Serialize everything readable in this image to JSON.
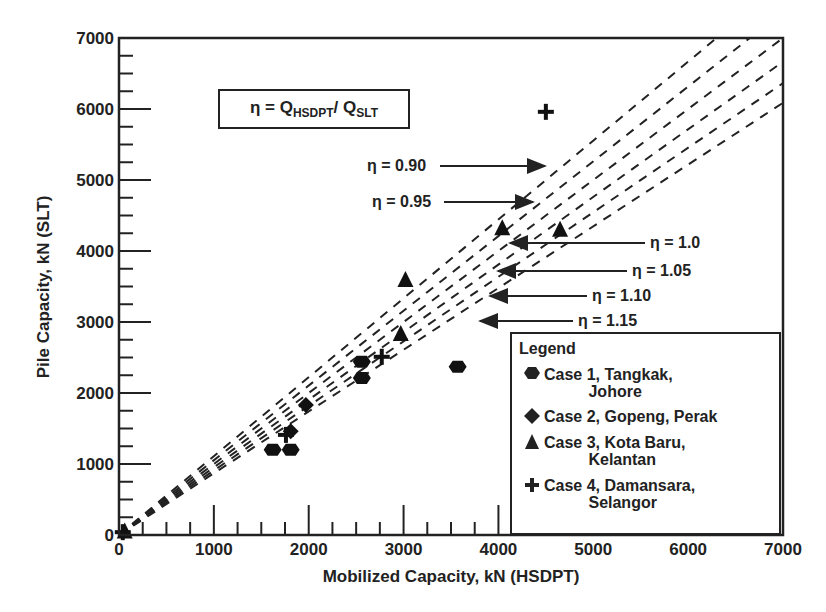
{
  "chart_data": {
    "type": "scatter",
    "title": "",
    "xlabel": "Mobilized Capacity, kN (HSDPT)",
    "ylabel": "Pile Capacity, kN (SLT)",
    "xlim": [
      0,
      7000
    ],
    "ylim": [
      0,
      7000
    ],
    "x_ticks": [
      0,
      1000,
      2000,
      3000,
      4000,
      5000,
      6000,
      7000
    ],
    "y_ticks": [
      0,
      1000,
      2000,
      3000,
      4000,
      5000,
      6000,
      7000
    ],
    "grid": false,
    "legend_position": "lower right",
    "annotation_formula": {
      "eta": "η = ",
      "q1": "Q",
      "sub1": "HSDPT",
      "slash": "/ ",
      "q2": "Q",
      "sub2": "SLT"
    },
    "reference_lines": [
      {
        "label": "η = 0.90",
        "eta": 0.9,
        "style": "dashed",
        "equation": "SLT = HSDPT / 0.90"
      },
      {
        "label": "η = 0.95",
        "eta": 0.95,
        "style": "dashed",
        "equation": "SLT = HSDPT / 0.95"
      },
      {
        "label": "η = 1.0",
        "eta": 1.0,
        "style": "dashed",
        "equation": "SLT = HSDPT / 1.0"
      },
      {
        "label": "η = 1.05",
        "eta": 1.05,
        "style": "dashed",
        "equation": "SLT = HSDPT / 1.05"
      },
      {
        "label": "η = 1.10",
        "eta": 1.1,
        "style": "dashed",
        "equation": "SLT = HSDPT / 1.10"
      },
      {
        "label": "η = 1.15",
        "eta": 1.15,
        "style": "dashed",
        "equation": "SLT = HSDPT / 1.15"
      }
    ],
    "series": [
      {
        "name": "Case 1, Tangkak, Johore",
        "marker": "hexagon",
        "points": [
          [
            1620,
            1200
          ],
          [
            1810,
            1200
          ],
          [
            2560,
            2440
          ],
          [
            2560,
            2210
          ],
          [
            3570,
            2370
          ]
        ]
      },
      {
        "name": "Case 2, Gopeng, Perak",
        "marker": "diamond",
        "points": [
          [
            1810,
            1460
          ],
          [
            1970,
            1830
          ]
        ]
      },
      {
        "name": "Case 3, Kota Baru, Kelantan",
        "marker": "triangle",
        "points": [
          [
            60,
            50
          ],
          [
            2970,
            2830
          ],
          [
            3020,
            3590
          ],
          [
            4040,
            4320
          ],
          [
            4650,
            4300
          ]
        ]
      },
      {
        "name": "Case 4, Damansara, Selangor",
        "marker": "cross",
        "points": [
          [
            40,
            40
          ],
          [
            1760,
            1410
          ],
          [
            2770,
            2510
          ],
          [
            4500,
            5960
          ]
        ]
      }
    ]
  },
  "legend": {
    "title": "Legend",
    "items": [
      {
        "label": "Case 1, Tangkak,\n          Johore"
      },
      {
        "label": "Case 2, Gopeng, Perak"
      },
      {
        "label": "Case 3, Kota Baru,\n          Kelantan"
      },
      {
        "label": "Case 4, Damansara,\n          Selangor"
      }
    ]
  }
}
